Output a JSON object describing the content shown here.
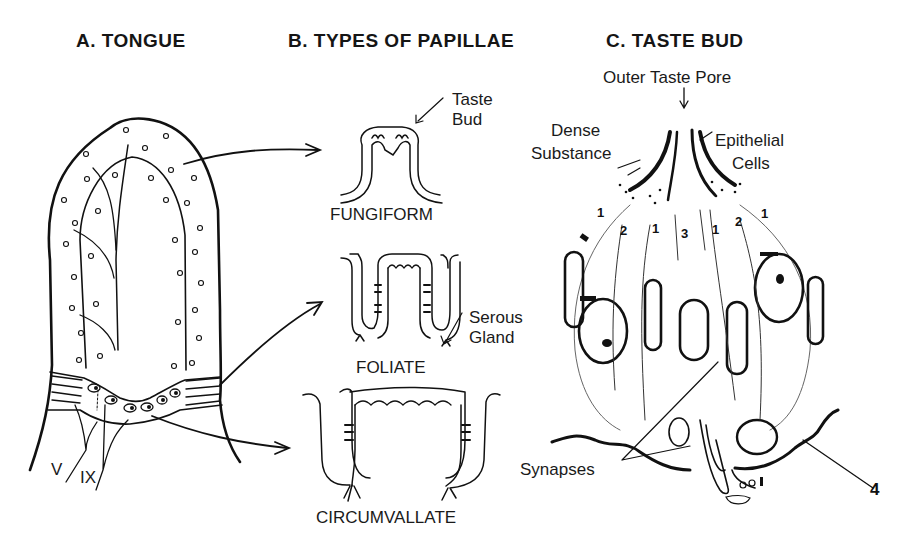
{
  "panels": {
    "tongue": {
      "title": "A. TONGUE",
      "nerve_labels": [
        "V",
        "IX"
      ]
    },
    "papillae": {
      "title": "B. TYPES OF PAPILLAE",
      "types": [
        "FUNGIFORM",
        "FOLIATE",
        "CIRCUMVALLATE"
      ],
      "callouts": {
        "taste_bud_line1": "Taste",
        "taste_bud_line2": "Bud",
        "serous_line1": "Serous",
        "serous_line2": "Gland"
      }
    },
    "taste_bud": {
      "title": "C. TASTE BUD",
      "callouts": {
        "outer_pore": "Outer Taste Pore",
        "dense_line1": "Dense",
        "dense_line2": "Substance",
        "epithelial_line1": "Epithelial",
        "epithelial_line2": "Cells",
        "synapses": "Synapses",
        "label_4": "4"
      },
      "cell_numbers": [
        "1",
        "2",
        "1",
        "3",
        "1",
        "2",
        "1"
      ]
    }
  },
  "colors": {
    "ink": "#111111",
    "background": "#ffffff"
  }
}
